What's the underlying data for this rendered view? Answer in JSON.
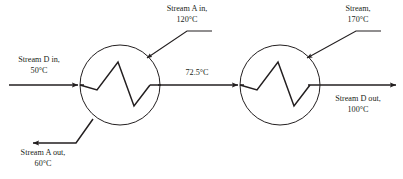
{
  "diagram": {
    "background_color": "#ffffff",
    "line_color": "#231f20",
    "text_color": "#231f20",
    "labels": {
      "stream_d_in": {
        "line1": "Stream D in,",
        "line2": "50°C"
      },
      "stream_a_in": {
        "line1": "Stream A in,",
        "line2": "120°C"
      },
      "stream_top_right": {
        "line1": "Stream,",
        "line2": "170°C"
      },
      "middle_temperature": {
        "line1": "72.5°C"
      },
      "stream_a_out": {
        "line1": "Stream A out,",
        "line2": "60°C"
      },
      "stream_d_out": {
        "line1": "Stream D out,",
        "line2": "100°C"
      }
    },
    "units": [
      {
        "name": "heat-exchanger-1",
        "center_x": 120,
        "center_y": 85,
        "radius": 40
      },
      {
        "name": "heat-exchanger-2",
        "center_x": 280,
        "center_y": 85,
        "radius": 40
      }
    ]
  }
}
